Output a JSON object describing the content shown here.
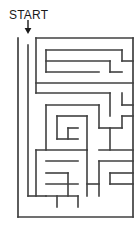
{
  "puzzle": {
    "kind": "maze",
    "title": "START",
    "start_label": "START",
    "entrance_marker": "down-arrow",
    "ink_color": "#404040",
    "text_color": "#1a1a1a",
    "background_color": "#ffffff"
  },
  "chart_data": {
    "type": "diagram",
    "title": "START",
    "subtype": "rectangular-grid-maze",
    "grid": {
      "cols": 10,
      "rows": 16,
      "cell_size": 11,
      "origin_x": 18,
      "origin_y": 38
    },
    "bounds": {
      "left": 18,
      "top": 38,
      "right": 133,
      "bottom": 217
    },
    "entrance": {
      "label": "START",
      "arrow_x": 28,
      "arrow_top_y": 20,
      "arrow_tip_y": 33,
      "opening_col": 0
    },
    "border_segments": [
      {
        "x1": 18,
        "y1": 38,
        "x2": 18,
        "y2": 217
      },
      {
        "x1": 18,
        "y1": 217,
        "x2": 133,
        "y2": 217
      },
      {
        "x1": 133,
        "y1": 38,
        "x2": 133,
        "y2": 217
      },
      {
        "x1": 36,
        "y1": 38,
        "x2": 133,
        "y2": 38
      }
    ],
    "wall_segments": [
      {
        "x1": 28,
        "y1": 45,
        "x2": 28,
        "y2": 196
      },
      {
        "x1": 36,
        "y1": 38,
        "x2": 36,
        "y2": 93
      },
      {
        "x1": 46,
        "y1": 50,
        "x2": 122,
        "y2": 50
      },
      {
        "x1": 122,
        "y1": 50,
        "x2": 122,
        "y2": 61
      },
      {
        "x1": 46,
        "y1": 50,
        "x2": 46,
        "y2": 72
      },
      {
        "x1": 46,
        "y1": 61,
        "x2": 110,
        "y2": 61
      },
      {
        "x1": 110,
        "y1": 61,
        "x2": 110,
        "y2": 72
      },
      {
        "x1": 110,
        "y1": 72,
        "x2": 122,
        "y2": 72
      },
      {
        "x1": 122,
        "y1": 61,
        "x2": 133,
        "y2": 61
      },
      {
        "x1": 46,
        "y1": 72,
        "x2": 99,
        "y2": 72
      },
      {
        "x1": 36,
        "y1": 83,
        "x2": 133,
        "y2": 83
      },
      {
        "x1": 36,
        "y1": 93,
        "x2": 110,
        "y2": 93
      },
      {
        "x1": 110,
        "y1": 93,
        "x2": 110,
        "y2": 116
      },
      {
        "x1": 122,
        "y1": 93,
        "x2": 122,
        "y2": 105
      },
      {
        "x1": 122,
        "y1": 105,
        "x2": 133,
        "y2": 105
      },
      {
        "x1": 46,
        "y1": 105,
        "x2": 99,
        "y2": 105
      },
      {
        "x1": 46,
        "y1": 105,
        "x2": 46,
        "y2": 150
      },
      {
        "x1": 99,
        "y1": 105,
        "x2": 99,
        "y2": 128
      },
      {
        "x1": 122,
        "y1": 116,
        "x2": 133,
        "y2": 116
      },
      {
        "x1": 122,
        "y1": 116,
        "x2": 122,
        "y2": 128
      },
      {
        "x1": 57,
        "y1": 116,
        "x2": 87,
        "y2": 116
      },
      {
        "x1": 57,
        "y1": 116,
        "x2": 57,
        "y2": 139
      },
      {
        "x1": 87,
        "y1": 116,
        "x2": 87,
        "y2": 150
      },
      {
        "x1": 68,
        "y1": 128,
        "x2": 78,
        "y2": 128
      },
      {
        "x1": 68,
        "y1": 128,
        "x2": 68,
        "y2": 139
      },
      {
        "x1": 57,
        "y1": 139,
        "x2": 78,
        "y2": 139
      },
      {
        "x1": 99,
        "y1": 128,
        "x2": 122,
        "y2": 128
      },
      {
        "x1": 110,
        "y1": 128,
        "x2": 110,
        "y2": 150
      },
      {
        "x1": 36,
        "y1": 150,
        "x2": 87,
        "y2": 150
      },
      {
        "x1": 99,
        "y1": 150,
        "x2": 133,
        "y2": 150
      },
      {
        "x1": 87,
        "y1": 150,
        "x2": 87,
        "y2": 196
      },
      {
        "x1": 36,
        "y1": 150,
        "x2": 36,
        "y2": 196
      },
      {
        "x1": 46,
        "y1": 161,
        "x2": 78,
        "y2": 161
      },
      {
        "x1": 99,
        "y1": 161,
        "x2": 133,
        "y2": 161
      },
      {
        "x1": 99,
        "y1": 161,
        "x2": 99,
        "y2": 196
      },
      {
        "x1": 46,
        "y1": 173,
        "x2": 68,
        "y2": 173
      },
      {
        "x1": 110,
        "y1": 173,
        "x2": 133,
        "y2": 173
      },
      {
        "x1": 110,
        "y1": 173,
        "x2": 110,
        "y2": 184
      },
      {
        "x1": 110,
        "y1": 184,
        "x2": 133,
        "y2": 184
      },
      {
        "x1": 46,
        "y1": 184,
        "x2": 78,
        "y2": 184
      },
      {
        "x1": 68,
        "y1": 173,
        "x2": 68,
        "y2": 196
      },
      {
        "x1": 46,
        "y1": 196,
        "x2": 78,
        "y2": 196
      },
      {
        "x1": 57,
        "y1": 196,
        "x2": 57,
        "y2": 207
      },
      {
        "x1": 78,
        "y1": 196,
        "x2": 78,
        "y2": 207
      },
      {
        "x1": 28,
        "y1": 196,
        "x2": 46,
        "y2": 196
      },
      {
        "x1": 87,
        "y1": 184,
        "x2": 99,
        "y2": 184
      }
    ]
  }
}
